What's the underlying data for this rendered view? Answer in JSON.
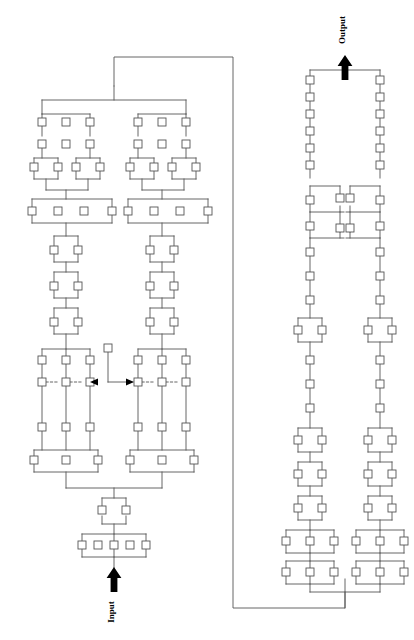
{
  "diagram": {
    "type": "node-link-block-diagram",
    "canvas": {
      "width": 414,
      "height": 640,
      "background": "#ffffff"
    },
    "style": {
      "node_stroke": "#555555",
      "node_fill": "#ffffff",
      "edge_stroke": "#555555",
      "arrow_fill": "#000000",
      "stroke_width": 0.9,
      "node_size": 8
    },
    "labels": {
      "input": "Input",
      "output": "Output",
      "input_rotation_deg": 90,
      "output_rotation_deg": 90
    },
    "flow": {
      "entry": "Input",
      "exit": "Output",
      "direction": "bottom-left to top-right via feedback bus"
    },
    "counts": {
      "left_column_nodes": 58,
      "right_column_nodes": 54,
      "total_nodes": 112,
      "arrowheads": 4,
      "dashed_links": 4
    },
    "nodes": [
      {
        "id": "L-r1-a",
        "x": 38,
        "y": 118
      },
      {
        "id": "L-r1-b",
        "x": 62,
        "y": 118
      },
      {
        "id": "L-r1-c",
        "x": 86,
        "y": 118
      },
      {
        "id": "L-r2-a",
        "x": 38,
        "y": 140
      },
      {
        "id": "L-r2-b",
        "x": 62,
        "y": 140
      },
      {
        "id": "L-r2-c",
        "x": 86,
        "y": 140
      },
      {
        "id": "L-d1-a",
        "x": 30,
        "y": 167
      },
      {
        "id": "L-d1-b",
        "x": 52,
        "y": 167
      },
      {
        "id": "L-d2-a",
        "x": 72,
        "y": 167
      },
      {
        "id": "L-d2-b",
        "x": 94,
        "y": 167
      },
      {
        "id": "L-w4-a",
        "x": 32,
        "y": 211
      },
      {
        "id": "L-w4-b",
        "x": 58,
        "y": 211
      },
      {
        "id": "L-w4-c",
        "x": 84,
        "y": 211
      },
      {
        "id": "L-w4-d",
        "x": 108,
        "y": 211
      },
      {
        "id": "L-m1-a",
        "x": 52,
        "y": 250
      },
      {
        "id": "L-m1-b",
        "x": 76,
        "y": 250
      },
      {
        "id": "L-m2-a",
        "x": 52,
        "y": 286
      },
      {
        "id": "L-m2-b",
        "x": 76,
        "y": 286
      },
      {
        "id": "L-m3-a",
        "x": 52,
        "y": 322
      },
      {
        "id": "L-m3-b",
        "x": 76,
        "y": 322
      },
      {
        "id": "L-t1-a",
        "x": 38,
        "y": 360
      },
      {
        "id": "L-t1-b",
        "x": 62,
        "y": 360
      },
      {
        "id": "L-t1-c",
        "x": 86,
        "y": 360
      },
      {
        "id": "L-t2-a",
        "x": 38,
        "y": 382
      },
      {
        "id": "L-t2-b",
        "x": 62,
        "y": 382
      },
      {
        "id": "L-t2-c",
        "x": 86,
        "y": 382
      },
      {
        "id": "L-t3-a",
        "x": 38,
        "y": 427
      },
      {
        "id": "L-t3-b",
        "x": 62,
        "y": 427
      },
      {
        "id": "L-t3-c",
        "x": 86,
        "y": 427
      },
      {
        "id": "L-t4-a",
        "x": 38,
        "y": 460
      },
      {
        "id": "L-t4-b",
        "x": 62,
        "y": 460
      },
      {
        "id": "L-t4-c",
        "x": 86,
        "y": 460
      },
      {
        "id": "L-tap",
        "x": 104,
        "y": 344
      },
      {
        "id": "L-f1-a",
        "x": 98,
        "y": 506
      },
      {
        "id": "L-f1-b",
        "x": 122,
        "y": 506
      },
      {
        "id": "L-f2-a",
        "x": 78,
        "y": 545
      },
      {
        "id": "L-f2-b",
        "x": 100,
        "y": 545
      },
      {
        "id": "L-f2-c",
        "x": 122,
        "y": 545
      },
      {
        "id": "L-f2-d",
        "x": 144,
        "y": 545
      }
    ],
    "edges_note": "vertical spines with horizontal bus bars; dashed short links inside wide rows; feedback bus from right-column base to left-column crown",
    "arrows": [
      {
        "name": "input-arrow",
        "x": 110,
        "y": 578,
        "dir": "up"
      },
      {
        "name": "output-arrow",
        "x": 345,
        "y": 60,
        "dir": "up"
      },
      {
        "name": "tap-arrow-left",
        "x": 90,
        "y": 381,
        "dir": "left"
      },
      {
        "name": "tap-arrow-right",
        "x": 136,
        "y": 381,
        "dir": "right"
      }
    ]
  }
}
